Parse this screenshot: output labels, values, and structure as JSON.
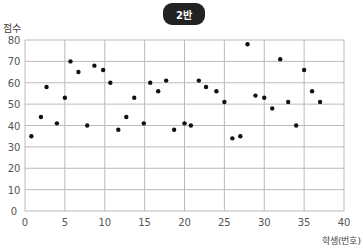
{
  "chart_data": {
    "type": "scatter",
    "title": "2반",
    "xlabel": "학생(번호)",
    "ylabel": "점수",
    "xlim": [
      0,
      40
    ],
    "ylim": [
      0,
      80
    ],
    "xticks": [
      0,
      5,
      10,
      15,
      20,
      25,
      30,
      35,
      40
    ],
    "yticks": [
      0,
      10,
      20,
      30,
      40,
      50,
      60,
      70,
      80
    ],
    "grid": true,
    "legend": null,
    "points": [
      {
        "x": 0.8,
        "y": 35
      },
      {
        "x": 2,
        "y": 44
      },
      {
        "x": 2.7,
        "y": 58
      },
      {
        "x": 4,
        "y": 41
      },
      {
        "x": 5,
        "y": 53
      },
      {
        "x": 5.7,
        "y": 70
      },
      {
        "x": 6.7,
        "y": 65
      },
      {
        "x": 7.8,
        "y": 40
      },
      {
        "x": 8.7,
        "y": 68
      },
      {
        "x": 9.8,
        "y": 66
      },
      {
        "x": 10.7,
        "y": 60
      },
      {
        "x": 11.7,
        "y": 38
      },
      {
        "x": 12.7,
        "y": 44
      },
      {
        "x": 13.7,
        "y": 53
      },
      {
        "x": 14.9,
        "y": 41
      },
      {
        "x": 15.7,
        "y": 60
      },
      {
        "x": 16.7,
        "y": 56
      },
      {
        "x": 17.7,
        "y": 61
      },
      {
        "x": 18.7,
        "y": 38
      },
      {
        "x": 20,
        "y": 41
      },
      {
        "x": 20.8,
        "y": 40
      },
      {
        "x": 21.8,
        "y": 61
      },
      {
        "x": 22.7,
        "y": 58
      },
      {
        "x": 24,
        "y": 56
      },
      {
        "x": 25,
        "y": 51
      },
      {
        "x": 26,
        "y": 34
      },
      {
        "x": 27,
        "y": 35
      },
      {
        "x": 27.9,
        "y": 78
      },
      {
        "x": 28.9,
        "y": 54
      },
      {
        "x": 30,
        "y": 53
      },
      {
        "x": 31,
        "y": 48
      },
      {
        "x": 32,
        "y": 71
      },
      {
        "x": 33,
        "y": 51
      },
      {
        "x": 34,
        "y": 40
      },
      {
        "x": 35,
        "y": 66
      },
      {
        "x": 36,
        "y": 56
      },
      {
        "x": 37,
        "y": 51
      }
    ]
  },
  "colors": {
    "badge_bg": "#222222",
    "point": "#111111",
    "grid": "#bbbbbb"
  }
}
